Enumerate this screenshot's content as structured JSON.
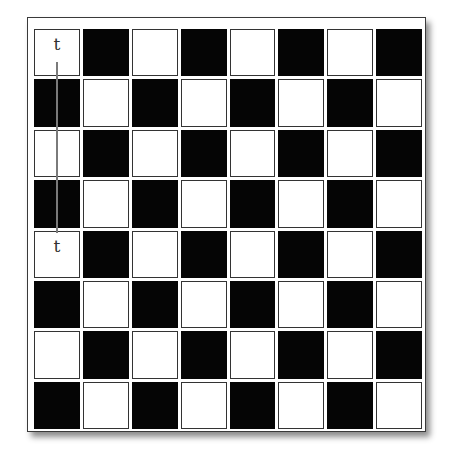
{
  "diagram": {
    "type": "chessboard",
    "rows": 8,
    "columns": 8,
    "top_left_color": "white",
    "colors": {
      "light_square": "#ffffff",
      "dark_square": "#050505",
      "square_border": "#333333",
      "frame_border": "#3a3a3a",
      "move_line": "#7a7a7a"
    },
    "labels": [
      {
        "text": "t",
        "row": 0,
        "col": 0
      },
      {
        "text": "t",
        "row": 4,
        "col": 0
      }
    ],
    "move_line": {
      "from": {
        "row": 0,
        "col": 0
      },
      "to": {
        "row": 4,
        "col": 0
      },
      "orientation": "vertical"
    }
  }
}
